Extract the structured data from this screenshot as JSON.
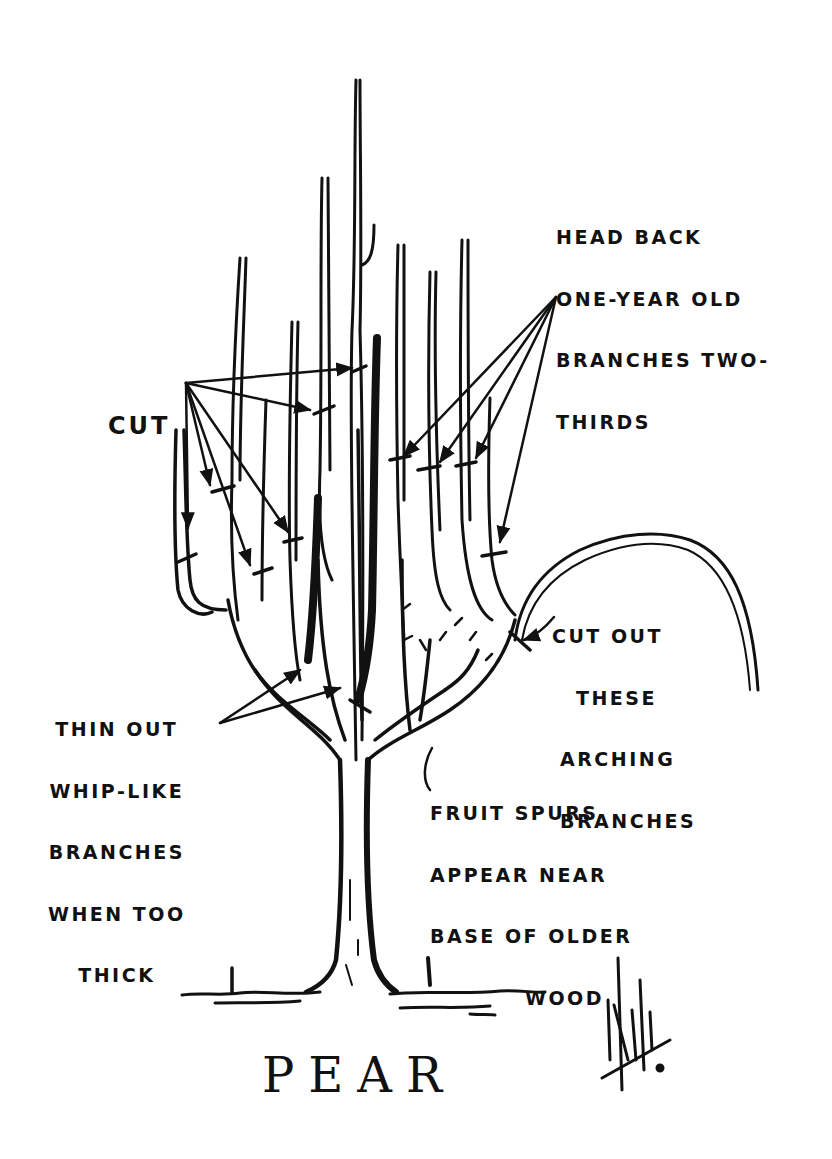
{
  "diagram": {
    "title": "PEAR",
    "ink_color": "#111111",
    "paper_color": "#ffffff",
    "labels": {
      "head_back": {
        "lines": [
          "HEAD BACK",
          "ONE-YEAR OLD",
          "BRANCHES TWO-",
          "THIRDS"
        ]
      },
      "cut": {
        "lines": [
          "CUT"
        ]
      },
      "cut_out": {
        "lines": [
          "CUT OUT",
          "THESE",
          "ARCHING",
          "BRANCHES"
        ]
      },
      "thin_out": {
        "lines": [
          "THIN OUT",
          "WHIP-LIKE",
          "BRANCHES",
          "WHEN TOO",
          "THICK"
        ]
      },
      "fruit_spurs": {
        "lines": [
          "FRUIT SPURS",
          "APPEAR NEAR",
          "BASE OF OLDER",
          "WOOD"
        ]
      }
    },
    "signature": {
      "icon": "artist-signature-icon"
    }
  }
}
